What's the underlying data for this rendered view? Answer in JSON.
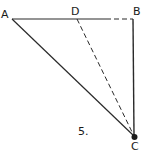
{
  "figure": {
    "number_label": "5.",
    "points": {
      "A": {
        "label": "A"
      },
      "B": {
        "label": "B"
      },
      "C": {
        "label": "C"
      },
      "D": {
        "label": "D"
      }
    },
    "segments": [
      {
        "from": "A",
        "to": "B",
        "style": "solid"
      },
      {
        "from": "B",
        "to": "C",
        "style": "solid"
      },
      {
        "from": "A",
        "to": "C",
        "style": "solid"
      },
      {
        "from": "D",
        "to": "C",
        "style": "dashed"
      }
    ],
    "colors": {
      "stroke": "#2a2a2a",
      "background": "#ffffff"
    }
  }
}
